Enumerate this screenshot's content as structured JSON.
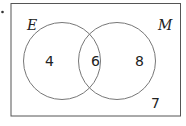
{
  "diagram": {
    "type": "venn",
    "sets": [
      {
        "label": "E",
        "only": "4"
      },
      {
        "label": "M",
        "only": "8"
      }
    ],
    "intersection": "6",
    "outside": "7",
    "colors": {
      "stroke": "#555555",
      "text": "#222222",
      "background": "#ffffff"
    }
  }
}
